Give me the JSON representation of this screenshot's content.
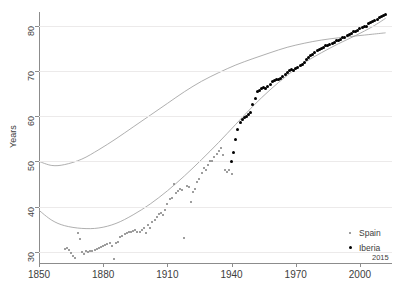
{
  "chart_data": {
    "type": "scatter",
    "title": "",
    "xlabel": "",
    "ylabel": "Years",
    "xlim": [
      1850,
      2015
    ],
    "ylim": [
      28,
      83
    ],
    "grid": true,
    "x_ticks": [
      1850,
      1880,
      1910,
      1940,
      1970,
      2000
    ],
    "x_end_tick": 2015,
    "y_ticks": [
      30,
      40,
      50,
      60,
      70,
      80
    ],
    "legend_position": "bottom-right",
    "legend": [
      "Spain",
      "Iberia"
    ],
    "series": [
      {
        "name": "Spain",
        "marker": "small-dot",
        "color": "#7e7e7e",
        "points": [
          [
            1862,
            30.6
          ],
          [
            1863,
            30.9
          ],
          [
            1864,
            30.4
          ],
          [
            1865,
            29.8
          ],
          [
            1866,
            29.2
          ],
          [
            1867,
            28.7
          ],
          [
            1868,
            34.1
          ],
          [
            1869,
            32.8
          ],
          [
            1870,
            30.0
          ],
          [
            1871,
            29.6
          ],
          [
            1872,
            30.1
          ],
          [
            1873,
            30.0
          ],
          [
            1874,
            30.2
          ],
          [
            1875,
            30.3
          ],
          [
            1876,
            30.4
          ],
          [
            1877,
            30.6
          ],
          [
            1878,
            30.8
          ],
          [
            1879,
            31.0
          ],
          [
            1880,
            31.3
          ],
          [
            1881,
            31.6
          ],
          [
            1882,
            31.8
          ],
          [
            1883,
            32.0
          ],
          [
            1884,
            31.4
          ],
          [
            1885,
            28.4
          ],
          [
            1886,
            32.0
          ],
          [
            1887,
            32.3
          ],
          [
            1888,
            33.2
          ],
          [
            1889,
            33.6
          ],
          [
            1890,
            34.0
          ],
          [
            1891,
            34.2
          ],
          [
            1892,
            34.5
          ],
          [
            1893,
            34.3
          ],
          [
            1894,
            34.6
          ],
          [
            1895,
            34.9
          ],
          [
            1896,
            34.3
          ],
          [
            1897,
            34.5
          ],
          [
            1898,
            34.8
          ],
          [
            1899,
            35.2
          ],
          [
            1900,
            34.2
          ],
          [
            1901,
            36.0
          ],
          [
            1902,
            35.3
          ],
          [
            1903,
            36.6
          ],
          [
            1904,
            37.0
          ],
          [
            1905,
            37.8
          ],
          [
            1906,
            38.3
          ],
          [
            1907,
            38.5
          ],
          [
            1908,
            38.1
          ],
          [
            1909,
            39.3
          ],
          [
            1910,
            40.6
          ],
          [
            1911,
            41.8
          ],
          [
            1912,
            42.0
          ],
          [
            1913,
            44.9
          ],
          [
            1914,
            43.0
          ],
          [
            1915,
            43.4
          ],
          [
            1916,
            43.8
          ],
          [
            1917,
            43.6
          ],
          [
            1918,
            33.0
          ],
          [
            1919,
            44.5
          ],
          [
            1920,
            44.3
          ],
          [
            1921,
            41.0
          ],
          [
            1922,
            43.2
          ],
          [
            1923,
            44.0
          ],
          [
            1924,
            45.5
          ],
          [
            1925,
            46.2
          ],
          [
            1926,
            47.4
          ],
          [
            1927,
            48.5
          ],
          [
            1928,
            48.2
          ],
          [
            1929,
            49.3
          ],
          [
            1930,
            50.1
          ],
          [
            1931,
            50.0
          ],
          [
            1932,
            51.0
          ],
          [
            1933,
            51.6
          ],
          [
            1934,
            52.4
          ],
          [
            1935,
            53.0
          ],
          [
            1936,
            51.5
          ],
          [
            1937,
            48.0
          ],
          [
            1938,
            47.7
          ],
          [
            1939,
            48.0
          ],
          [
            1940,
            47.2
          ]
        ]
      },
      {
        "name": "Iberia",
        "marker": "dot",
        "color": "#000000",
        "points": [
          [
            1940,
            50.0
          ],
          [
            1941,
            52.0
          ],
          [
            1942,
            54.8
          ],
          [
            1943,
            57.0
          ],
          [
            1944,
            58.6
          ],
          [
            1945,
            59.3
          ],
          [
            1946,
            59.6
          ],
          [
            1947,
            60.0
          ],
          [
            1948,
            60.4
          ],
          [
            1949,
            60.7
          ],
          [
            1950,
            62.5
          ],
          [
            1951,
            64.0
          ],
          [
            1952,
            65.4
          ],
          [
            1953,
            65.7
          ],
          [
            1954,
            66.2
          ],
          [
            1955,
            66.4
          ],
          [
            1956,
            66.0
          ],
          [
            1957,
            66.5
          ],
          [
            1958,
            67.0
          ],
          [
            1959,
            67.7
          ],
          [
            1960,
            67.9
          ],
          [
            1961,
            68.0
          ],
          [
            1962,
            68.2
          ],
          [
            1963,
            68.4
          ],
          [
            1964,
            68.8
          ],
          [
            1965,
            69.3
          ],
          [
            1966,
            69.6
          ],
          [
            1967,
            70.0
          ],
          [
            1968,
            70.2
          ],
          [
            1969,
            70.0
          ],
          [
            1970,
            70.5
          ],
          [
            1971,
            70.8
          ],
          [
            1972,
            71.1
          ],
          [
            1973,
            71.3
          ],
          [
            1974,
            71.9
          ],
          [
            1975,
            72.4
          ],
          [
            1976,
            73.0
          ],
          [
            1977,
            73.4
          ],
          [
            1978,
            73.6
          ],
          [
            1979,
            74.0
          ],
          [
            1980,
            74.4
          ],
          [
            1981,
            74.7
          ],
          [
            1982,
            75.0
          ],
          [
            1983,
            75.1
          ],
          [
            1984,
            75.5
          ],
          [
            1985,
            75.6
          ],
          [
            1986,
            75.8
          ],
          [
            1987,
            76.1
          ],
          [
            1988,
            76.3
          ],
          [
            1989,
            76.6
          ],
          [
            1990,
            76.8
          ],
          [
            1991,
            77.0
          ],
          [
            1992,
            77.3
          ],
          [
            1993,
            77.4
          ],
          [
            1994,
            77.8
          ],
          [
            1995,
            78.0
          ],
          [
            1996,
            78.3
          ],
          [
            1997,
            78.6
          ],
          [
            1998,
            78.7
          ],
          [
            1999,
            78.9
          ],
          [
            2000,
            79.3
          ],
          [
            2001,
            79.6
          ],
          [
            2002,
            79.8
          ],
          [
            2003,
            79.9
          ],
          [
            2004,
            80.5
          ],
          [
            2005,
            80.6
          ],
          [
            2006,
            81.0
          ],
          [
            2007,
            81.2
          ],
          [
            2008,
            81.4
          ],
          [
            2009,
            81.7
          ],
          [
            2010,
            82.0
          ],
          [
            2011,
            82.2
          ],
          [
            2012,
            82.5
          ]
        ]
      }
    ],
    "fit_lines": [
      {
        "name": "upper-fit",
        "color": "#9a9a9a",
        "points": [
          [
            1850,
            50.0
          ],
          [
            1856,
            49.1
          ],
          [
            1862,
            49.3
          ],
          [
            1870,
            50.5
          ],
          [
            1878,
            52.6
          ],
          [
            1886,
            55.0
          ],
          [
            1894,
            57.6
          ],
          [
            1902,
            60.2
          ],
          [
            1910,
            62.8
          ],
          [
            1918,
            65.4
          ],
          [
            1926,
            67.7
          ],
          [
            1934,
            69.6
          ],
          [
            1942,
            71.3
          ],
          [
            1950,
            72.7
          ],
          [
            1958,
            74.0
          ],
          [
            1966,
            75.2
          ],
          [
            1974,
            76.1
          ],
          [
            1982,
            76.8
          ],
          [
            1990,
            77.3
          ],
          [
            1998,
            77.7
          ],
          [
            2006,
            78.1
          ],
          [
            2012,
            78.4
          ]
        ]
      },
      {
        "name": "lower-fit",
        "color": "#9a9a9a",
        "points": [
          [
            1850,
            39.2
          ],
          [
            1856,
            37.0
          ],
          [
            1862,
            35.8
          ],
          [
            1870,
            35.2
          ],
          [
            1878,
            35.3
          ],
          [
            1886,
            36.3
          ],
          [
            1894,
            38.2
          ],
          [
            1902,
            40.6
          ],
          [
            1910,
            43.5
          ],
          [
            1918,
            46.8
          ],
          [
            1926,
            50.4
          ],
          [
            1934,
            54.2
          ],
          [
            1942,
            58.2
          ],
          [
            1950,
            62.2
          ],
          [
            1958,
            65.8
          ],
          [
            1966,
            69.0
          ],
          [
            1974,
            71.8
          ],
          [
            1982,
            74.0
          ],
          [
            1990,
            76.0
          ],
          [
            1998,
            77.8
          ],
          [
            2006,
            79.8
          ],
          [
            2012,
            81.6
          ]
        ]
      }
    ]
  },
  "axes": {
    "y_title": "Years"
  },
  "legend": {
    "items": [
      {
        "label": "Spain",
        "marker": "small-dot-marker",
        "color": "#7e7e7e"
      },
      {
        "label": "Iberia",
        "marker": "dot-marker",
        "color": "#000000"
      }
    ]
  }
}
